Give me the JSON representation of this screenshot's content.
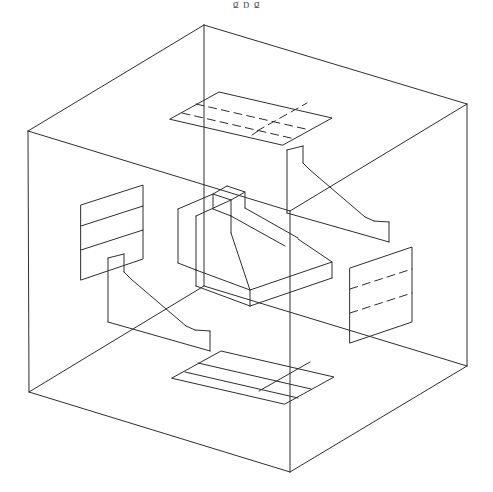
{
  "figure": {
    "caption_fragment": "g                             p                  g",
    "drawing_type": "technical-line-drawing",
    "line_color": "#2e2e33",
    "background_color": "#ffffff",
    "line_width_px": 1,
    "hidden_line_style": "dashed",
    "canvas": {
      "width": 493,
      "height": 492
    }
  },
  "geometry": {
    "glass_box": {
      "name": "transparent projection box",
      "vertices": {
        "top_back": [
          204,
          25
        ],
        "top_left": [
          28,
          131
        ],
        "top_right": [
          467,
          104
        ],
        "top_front": [
          290,
          211
        ],
        "bottom_left": [
          29,
          392
        ],
        "bottom_right": [
          467,
          366
        ],
        "bottom_front": [
          290,
          472
        ],
        "bottom_back": [
          204,
          286
        ]
      },
      "edges": [
        "top_back-top_left",
        "top_back-top_right",
        "top_left-top_front",
        "top_right-top_front",
        "top_left-bottom_left",
        "top_right-bottom_right",
        "top_front-bottom_front",
        "top_back-bottom_back",
        "bottom_left-bottom_front",
        "bottom_right-bottom_front",
        "bottom_left-bottom_back",
        "bottom_right-bottom_back"
      ]
    },
    "top_view_plane": {
      "name": "top view projection plane",
      "hidden_lines": true,
      "outline": [
        [
          170,
          119
        ],
        [
          219,
          92
        ],
        [
          332,
          118
        ],
        [
          283,
          145
        ]
      ]
    },
    "bottom_view_plane": {
      "name": "bottom view projection plane",
      "hidden_lines": false,
      "outline": [
        [
          172,
          378
        ],
        [
          221,
          351
        ],
        [
          334,
          377
        ],
        [
          285,
          404
        ]
      ]
    },
    "left_view_plane": {
      "name": "left side view projection plane",
      "hidden_lines": false,
      "outline": [
        [
          81,
          205
        ],
        [
          143,
          185
        ],
        [
          143,
          259
        ],
        [
          81,
          280
        ]
      ]
    },
    "right_view_plane": {
      "name": "right side view projection plane",
      "hidden_lines": true,
      "outline": [
        [
          350,
          268
        ],
        [
          412,
          247
        ],
        [
          412,
          322
        ],
        [
          350,
          343
        ]
      ]
    },
    "center_object": {
      "name": "angled bracket solid",
      "description": "L-shaped block with sloped face"
    },
    "upper_right_profile": {
      "name": "front view profile outline"
    },
    "lower_left_profile": {
      "name": "rear view profile outline"
    }
  },
  "chart_data": {
    "type": "line",
    "xlabel": "",
    "ylabel": "",
    "categories": [
      "glass-box",
      "top-view-plane",
      "bottom-view-plane",
      "left-view-plane",
      "right-view-plane",
      "center-object",
      "upper-right-profile",
      "lower-left-profile"
    ],
    "values": [
      12,
      8,
      8,
      6,
      6,
      22,
      10,
      10
    ],
    "series": [
      {
        "name": "edge count per component",
        "values": [
          12,
          8,
          8,
          6,
          6,
          22,
          10,
          10
        ]
      }
    ],
    "grid": false,
    "legend_position": "none"
  }
}
